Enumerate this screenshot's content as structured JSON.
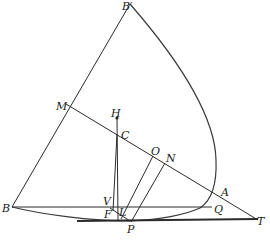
{
  "diagram": {
    "type": "geometric-construction",
    "points": {
      "B_prime": {
        "label": "B′",
        "x": 126,
        "y": 9
      },
      "M": {
        "label": "M",
        "x": 57,
        "y": 110
      },
      "H": {
        "label": "H",
        "x": 112,
        "y": 119
      },
      "C": {
        "label": "C",
        "x": 121,
        "y": 138
      },
      "O": {
        "label": "O",
        "x": 152,
        "y": 157
      },
      "N": {
        "label": "N",
        "x": 165,
        "y": 163
      },
      "A": {
        "label": "A",
        "x": 223,
        "y": 196
      },
      "V": {
        "label": "V",
        "x": 104,
        "y": 206
      },
      "B": {
        "label": "B",
        "x": 2,
        "y": 212
      },
      "Q": {
        "label": "Q",
        "x": 212,
        "y": 212
      },
      "F": {
        "label": "F",
        "x": 103,
        "y": 219
      },
      "L": {
        "label": "L",
        "x": 120,
        "y": 216
      },
      "P": {
        "label": "P",
        "x": 125,
        "y": 233
      },
      "T": {
        "label": "T",
        "x": 256,
        "y": 224
      }
    },
    "stroke_color": "#2a2a2a",
    "background": "#ffffff"
  }
}
